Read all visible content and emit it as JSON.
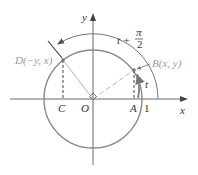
{
  "diagram": {
    "type": "unit-circle-rotation",
    "axes": {
      "x_label": "x",
      "y_label": "y"
    },
    "points": {
      "origin": "O",
      "A": "A",
      "C": "C",
      "one": "1",
      "B": "B(x, y)",
      "D": "D(−y, x)"
    },
    "angles": {
      "small": "t",
      "large_prefix": "t +",
      "large_pi": "π",
      "large_den": "2"
    },
    "colors": {
      "circle": "#8a8a8a",
      "axes": "#6a6a6a",
      "radius": "#b5b5b5",
      "text": "#333333",
      "grey_text": "#9a9a9a"
    }
  }
}
